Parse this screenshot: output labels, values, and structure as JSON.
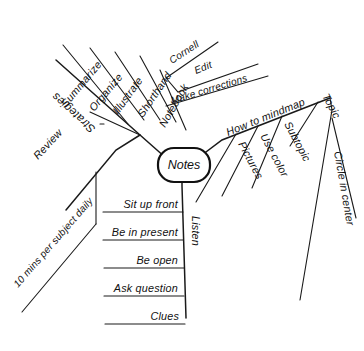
{
  "diagram": {
    "background_color": "#ffffff",
    "ink_color": "#111111",
    "center": {
      "label": "Notes",
      "shape": "rounded-rectangle"
    },
    "branches": [
      {
        "id": "strategies",
        "label": "Strategies",
        "direction": "upper-left",
        "label_rotated_180": true,
        "children": [
          {
            "label": "Summarize"
          },
          {
            "label": "Organize"
          },
          {
            "label": "Illustrate"
          },
          {
            "label": "Shorthand"
          },
          {
            "label": "Notebook",
            "children": [
              {
                "label": "Cornell"
              },
              {
                "label": "Edit"
              },
              {
                "label": "Make corrections"
              }
            ]
          }
        ]
      },
      {
        "id": "review",
        "label": "Review",
        "direction": "lower-left",
        "children": [
          {
            "label": "10 mins per subject daily"
          }
        ]
      },
      {
        "id": "how-to-mindmap",
        "label": "How to mindmap",
        "direction": "upper-right",
        "children": [
          {
            "label": "Pictures"
          },
          {
            "label": "Use color"
          },
          {
            "label": "Subtopic"
          },
          {
            "label": "Topic"
          },
          {
            "label": "Circle in center"
          }
        ]
      },
      {
        "id": "listen",
        "label": "Listen",
        "direction": "down",
        "label_rotated_90": true,
        "children": [
          {
            "label": "Sit up front"
          },
          {
            "label": "Be in present"
          },
          {
            "label": "Be open"
          },
          {
            "label": "Ask question"
          },
          {
            "label": "Clues"
          }
        ]
      }
    ]
  }
}
